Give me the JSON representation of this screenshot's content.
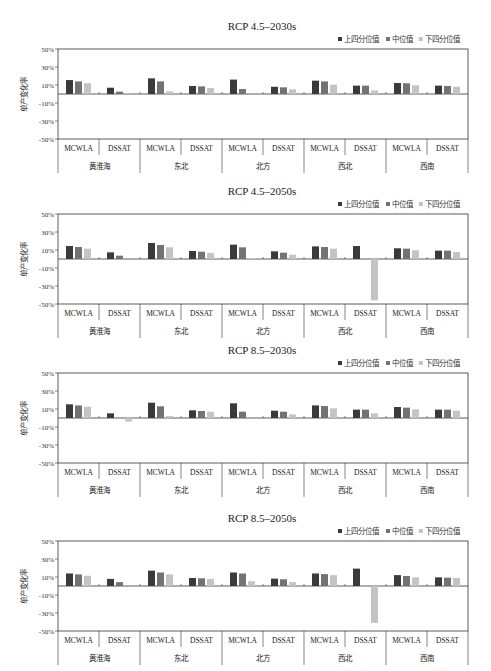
{
  "chart_data": [
    {
      "type": "bar",
      "title": "RCP 4.5–2030s",
      "ylabel": "单产变化率",
      "ylim": [
        -50,
        50
      ],
      "yticks": [
        "50%",
        "30%",
        "10%",
        "-10%",
        "-30%",
        "-50%"
      ],
      "ytick_values": [
        50,
        30,
        10,
        -10,
        -30,
        -50
      ],
      "legend": [
        "上四分位值",
        "中位值",
        "下四分位值"
      ],
      "legend_position": "top-right",
      "regions": [
        "黄淮海",
        "东北",
        "北方",
        "西北",
        "西南"
      ],
      "models": [
        "MCWLA",
        "DSSAT"
      ],
      "series": [
        {
          "name": "上四分位值",
          "values": [
            15.5,
            7.0,
            17.4,
            8.9,
            16.0,
            8.0,
            14.8,
            9.3,
            12.2,
            9.3
          ]
        },
        {
          "name": "中位值",
          "values": [
            14.0,
            2.6,
            14.0,
            8.5,
            5.5,
            7.4,
            14.0,
            9.3,
            11.9,
            8.9
          ]
        },
        {
          "name": "下四分位值",
          "values": [
            12.0,
            0.7,
            3.0,
            6.7,
            0.0,
            5.2,
            10.4,
            4.0,
            9.6,
            8.1
          ]
        }
      ]
    },
    {
      "type": "bar",
      "title": "RCP 4.5–2050s",
      "ylabel": "单产变化率",
      "ylim": [
        -50,
        50
      ],
      "yticks": [
        "50%",
        "30%",
        "10%",
        "-10%",
        "-30%",
        "-50%"
      ],
      "ytick_values": [
        50,
        30,
        10,
        -10,
        -30,
        -50
      ],
      "legend": [
        "上四分位值",
        "中位值",
        "下四分位值"
      ],
      "legend_position": "top-right",
      "regions": [
        "黄淮海",
        "东北",
        "北方",
        "西北",
        "西南"
      ],
      "models": [
        "MCWLA",
        "DSSAT"
      ],
      "series": [
        {
          "name": "上四分位值",
          "values": [
            14.4,
            7.4,
            17.8,
            8.9,
            15.9,
            8.5,
            14.0,
            14.4,
            11.9,
            9.3
          ]
        },
        {
          "name": "中位值",
          "values": [
            13.3,
            3.7,
            15.6,
            8.1,
            13.0,
            7.0,
            13.3,
            0.0,
            11.5,
            9.3
          ]
        },
        {
          "name": "下四分位值",
          "values": [
            11.5,
            0.0,
            13.0,
            6.7,
            1.1,
            4.8,
            11.5,
            -46.0,
            9.6,
            7.8
          ]
        }
      ]
    },
    {
      "type": "bar",
      "title": "RCP 8.5–2030s",
      "ylabel": "单产变化率",
      "ylim": [
        -50,
        50
      ],
      "yticks": [
        "50%",
        "30%",
        "10%",
        "-10%",
        "-30%",
        "-50%"
      ],
      "ytick_values": [
        50,
        30,
        10,
        -10,
        -30,
        -50
      ],
      "legend": [
        "上四分位值",
        "中位值",
        "下四分位值"
      ],
      "legend_position": "top-right",
      "regions": [
        "黄淮海",
        "东北",
        "北方",
        "西北",
        "西南"
      ],
      "models": [
        "MCWLA",
        "DSSAT"
      ],
      "series": [
        {
          "name": "上四分位值",
          "values": [
            15.2,
            5.2,
            17.0,
            8.5,
            16.3,
            8.1,
            14.0,
            9.3,
            12.2,
            9.3
          ]
        },
        {
          "name": "中位值",
          "values": [
            14.0,
            0.0,
            13.0,
            7.8,
            7.0,
            7.0,
            13.3,
            9.3,
            11.5,
            9.3
          ]
        },
        {
          "name": "下四分位值",
          "values": [
            12.6,
            -4.0,
            2.2,
            7.0,
            0.0,
            4.0,
            10.7,
            5.2,
            9.6,
            8.1
          ]
        }
      ]
    },
    {
      "type": "bar",
      "title": "RCP 8.5–2050s",
      "ylabel": "单产变化率",
      "ylim": [
        -50,
        50
      ],
      "yticks": [
        "50%",
        "30%",
        "10%",
        "-10%",
        "-30%",
        "-50%"
      ],
      "ytick_values": [
        50,
        30,
        10,
        -10,
        -30,
        -50
      ],
      "legend": [
        "上四分位值",
        "中位值",
        "下四分位值"
      ],
      "legend_position": "top-right",
      "regions": [
        "黄淮海",
        "东北",
        "北方",
        "西北",
        "西南"
      ],
      "models": [
        "MCWLA",
        "DSSAT"
      ],
      "series": [
        {
          "name": "上四分位值",
          "values": [
            13.9,
            7.9,
            17.1,
            8.9,
            15.0,
            8.2,
            13.9,
            19.3,
            12.1,
            9.6
          ]
        },
        {
          "name": "中位值",
          "values": [
            12.9,
            4.3,
            15.0,
            8.6,
            13.9,
            7.5,
            13.2,
            0.0,
            11.1,
            9.3
          ]
        },
        {
          "name": "下四分位值",
          "values": [
            11.4,
            0.0,
            12.9,
            7.9,
            5.4,
            4.3,
            12.1,
            -41.0,
            9.6,
            8.9
          ]
        }
      ]
    }
  ],
  "colors": {
    "upper_quartile": "#3a3a3a",
    "median": "#737373",
    "lower_quartile": "#c4c4c4",
    "axis": "#333333"
  }
}
